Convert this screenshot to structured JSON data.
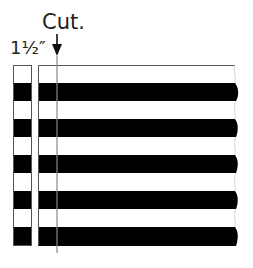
{
  "labels": {
    "cut": "Cut.",
    "strip_width": "1½″"
  },
  "colors": {
    "stripe_dark": "#000000",
    "stripe_light": "#ffffff",
    "outline": "#555555",
    "cut_line": "#888888"
  },
  "diagram": {
    "stripe_count": 10,
    "pattern": [
      "white",
      "black",
      "white",
      "black",
      "white",
      "black",
      "white",
      "black",
      "white",
      "black"
    ],
    "top": 65,
    "bottom": 246,
    "cut_strip": {
      "x": 13,
      "width": 19
    },
    "remaining_fabric": {
      "x": 38,
      "right_edge": 235
    },
    "cut_line_x": 57
  }
}
